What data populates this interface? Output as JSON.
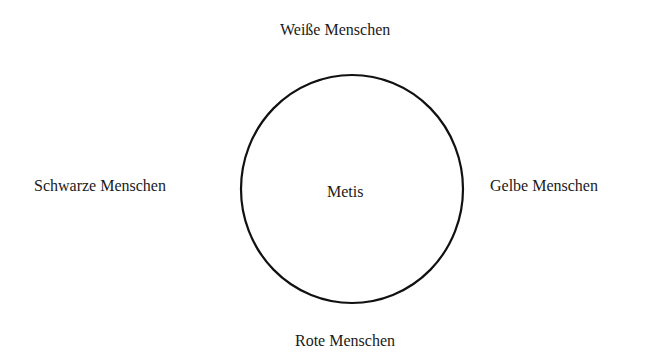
{
  "diagram": {
    "center_label": "Metis",
    "labels": {
      "top": "Weiße Menschen",
      "left": "Schwarze Menschen",
      "right": "Gelbe Menschen",
      "bottom": "Rote Menschen"
    },
    "shape": "circle",
    "stroke_color": "#111111",
    "background_color": "#ffffff"
  }
}
